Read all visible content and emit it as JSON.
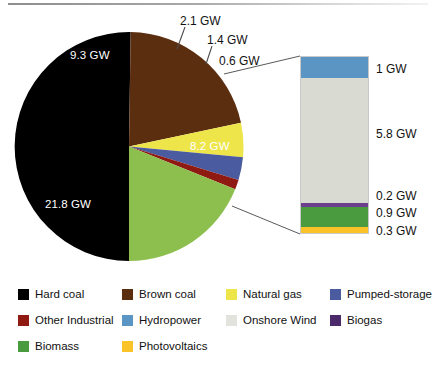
{
  "chart_data": {
    "type": "pie",
    "title": "",
    "unit": "GW",
    "categories": [
      "Hard coal",
      "Brown coal",
      "Natural gas",
      "Pumped-storage",
      "Other Industrial",
      "Renewables"
    ],
    "values": [
      21.8,
      9.3,
      2.1,
      1.4,
      0.6,
      8.2
    ],
    "labels": [
      "21.8 GW",
      "9.3 GW",
      "2.1 GW",
      "1.4 GW",
      "0.6 GW",
      "8.2 GW"
    ],
    "colors": [
      "#000000",
      "#5C2E10",
      "#EDE54A",
      "#4A5BA0",
      "#8E1A12",
      "#8DBF4F"
    ],
    "legend_position": "bottom",
    "breakout": {
      "type": "bar",
      "stacked": true,
      "source_category": "Renewables",
      "source_value": 8.2,
      "categories": [
        "Hydropower",
        "Onshore Wind",
        "Biogas",
        "Biomass",
        "Photovoltaics"
      ],
      "values": [
        1.0,
        5.8,
        0.2,
        0.9,
        0.3
      ],
      "labels": [
        "1 GW",
        "5.8 GW",
        "0.2 GW",
        "0.9 GW",
        "0.3 GW"
      ],
      "colors": [
        "#5B95C4",
        "#D9DAD1",
        "#6B3E8E",
        "#4A9A3F",
        "#FBC32A"
      ]
    }
  },
  "pie": {
    "slices": [
      {
        "name": "hard-coal",
        "label": "21.8 GW",
        "value": 21.8,
        "color": "#000000"
      },
      {
        "name": "brown-coal",
        "label": "9.3 GW",
        "value": 9.3,
        "color": "#5C2E10"
      },
      {
        "name": "natural-gas",
        "label": "2.1 GW",
        "value": 2.1,
        "color": "#EDE54A"
      },
      {
        "name": "pumped-storage",
        "label": "1.4 GW",
        "value": 1.4,
        "color": "#4A5BA0"
      },
      {
        "name": "other-industrial",
        "label": "0.6 GW",
        "value": 0.6,
        "color": "#8E1A12"
      },
      {
        "name": "renewables",
        "label": "8.2 GW",
        "value": 8.2,
        "color": "#8DBF4F"
      }
    ],
    "inner_labels": {
      "brown_coal": "9.3 GW",
      "hard_coal": "21.8 GW",
      "renewables": "8.2 GW"
    },
    "callouts": {
      "natural_gas": "2.1 GW",
      "pumped_storage": "1.4 GW",
      "other_industrial": "0.6 GW"
    }
  },
  "bar": {
    "segments": [
      {
        "name": "hydropower",
        "label": "1 GW",
        "value": 1.0,
        "color": "#5B95C4"
      },
      {
        "name": "onshore-wind",
        "label": "5.8 GW",
        "value": 5.8,
        "color": "#D9DAD1"
      },
      {
        "name": "biogas",
        "label": "0.2 GW",
        "value": 0.2,
        "color": "#6B3E8E"
      },
      {
        "name": "biomass",
        "label": "0.9 GW",
        "value": 0.9,
        "color": "#4A9A3F"
      },
      {
        "name": "photovoltaics",
        "label": "0.3 GW",
        "value": 0.3,
        "color": "#FBC32A"
      }
    ]
  },
  "legend": {
    "items": [
      {
        "name": "hard-coal",
        "label": "Hard coal",
        "color": "#000000"
      },
      {
        "name": "brown-coal",
        "label": "Brown coal",
        "color": "#5C2E10"
      },
      {
        "name": "natural-gas",
        "label": "Natural gas",
        "color": "#EDE54A"
      },
      {
        "name": "pumped-storage",
        "label": "Pumped-storage",
        "color": "#4A5BA0"
      },
      {
        "name": "other-industrial",
        "label": "Other Industrial",
        "color": "#8E1A12"
      },
      {
        "name": "hydropower",
        "label": "Hydropower",
        "color": "#5B95C4"
      },
      {
        "name": "onshore-wind",
        "label": "Onshore Wind",
        "color": "#E2E3DC"
      },
      {
        "name": "biogas",
        "label": "Biogas",
        "color": "#4B2A6B"
      },
      {
        "name": "biomass",
        "label": "Biomass",
        "color": "#4A9A3F"
      },
      {
        "name": "photovoltaics",
        "label": "Photovoltaics",
        "color": "#FBC32A"
      }
    ]
  }
}
